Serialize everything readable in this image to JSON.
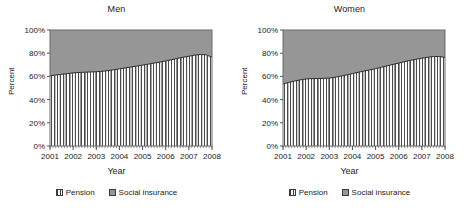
{
  "figure": {
    "panels": [
      "men",
      "women"
    ]
  },
  "axes": {
    "ylabel": "Percent",
    "xlabel": "Year",
    "yticks": [
      "0%",
      "20%",
      "40%",
      "60%",
      "80%",
      "100%"
    ],
    "xticks": [
      "2001",
      "2002",
      "2003",
      "2004",
      "2005",
      "2006",
      "2007",
      "2008"
    ]
  },
  "legend": {
    "items": [
      {
        "label": "Pension",
        "swatch": "pension-swatch-icon",
        "color": "#ffffff"
      },
      {
        "label": "Social insurance",
        "swatch": "social-insurance-swatch-icon",
        "color": "#969696"
      }
    ]
  },
  "colors": {
    "social_insurance": "#969696",
    "pension": "#ffffff",
    "hatch": "#3a3a3a",
    "axis": "#555555",
    "text": "#222222"
  },
  "chart_data": [
    {
      "type": "area",
      "title": "Men",
      "xlabel": "Year",
      "ylabel": "Percent",
      "ylim": [
        0,
        100
      ],
      "xlim": [
        2001,
        2008
      ],
      "grid": false,
      "legend_position": "bottom",
      "stacked": true,
      "categories": [
        "2001",
        "2001.25",
        "2001.5",
        "2001.75",
        "2002",
        "2002.25",
        "2002.5",
        "2002.75",
        "2003",
        "2003.25",
        "2003.5",
        "2003.75",
        "2004",
        "2004.25",
        "2004.5",
        "2004.75",
        "2005",
        "2005.25",
        "2005.5",
        "2005.75",
        "2006",
        "2006.25",
        "2006.5",
        "2006.75",
        "2007",
        "2007.25",
        "2007.5",
        "2007.75",
        "2008"
      ],
      "series": [
        {
          "name": "Pension",
          "values": [
            60.5,
            61.2,
            61.8,
            62.4,
            63.0,
            63.4,
            63.6,
            63.8,
            64.0,
            64.4,
            65.0,
            65.7,
            66.5,
            67.3,
            68.1,
            68.9,
            69.7,
            70.6,
            71.5,
            72.4,
            73.3,
            74.4,
            75.5,
            76.5,
            77.4,
            78.3,
            78.9,
            78.6,
            76.5
          ]
        },
        {
          "name": "Social insurance",
          "values": [
            39.5,
            38.8,
            38.2,
            37.6,
            37.0,
            36.6,
            36.4,
            36.2,
            36.0,
            35.6,
            35.0,
            34.3,
            33.5,
            32.7,
            31.9,
            31.1,
            30.3,
            29.4,
            28.5,
            27.6,
            26.7,
            25.6,
            24.5,
            23.5,
            22.6,
            21.7,
            21.1,
            21.4,
            23.5
          ]
        }
      ]
    },
    {
      "type": "area",
      "title": "Women",
      "xlabel": "Year",
      "ylabel": "Percent",
      "ylim": [
        0,
        100
      ],
      "xlim": [
        2001,
        2008
      ],
      "grid": false,
      "legend_position": "bottom",
      "stacked": true,
      "categories": [
        "2001",
        "2001.25",
        "2001.5",
        "2001.75",
        "2002",
        "2002.25",
        "2002.5",
        "2002.75",
        "2003",
        "2003.25",
        "2003.5",
        "2003.75",
        "2004",
        "2004.25",
        "2004.5",
        "2004.75",
        "2005",
        "2005.25",
        "2005.5",
        "2005.75",
        "2006",
        "2006.25",
        "2006.5",
        "2006.75",
        "2007",
        "2007.25",
        "2007.5",
        "2007.75",
        "2008"
      ],
      "series": [
        {
          "name": "Pension",
          "values": [
            53.5,
            54.8,
            56.0,
            57.0,
            57.8,
            58.1,
            58.2,
            58.3,
            58.5,
            59.3,
            60.3,
            61.3,
            62.4,
            63.5,
            64.6,
            65.6,
            66.7,
            67.9,
            69.1,
            70.3,
            71.5,
            72.7,
            73.8,
            74.8,
            75.7,
            76.5,
            77.1,
            77.2,
            76.3
          ]
        },
        {
          "name": "Social insurance",
          "values": [
            46.5,
            45.2,
            44.0,
            43.0,
            42.2,
            41.9,
            41.8,
            41.7,
            41.5,
            40.7,
            39.7,
            38.7,
            37.6,
            36.5,
            35.4,
            34.4,
            33.3,
            32.1,
            30.9,
            29.7,
            28.5,
            27.3,
            26.2,
            25.2,
            24.3,
            23.5,
            22.9,
            22.8,
            23.7
          ]
        }
      ]
    }
  ]
}
